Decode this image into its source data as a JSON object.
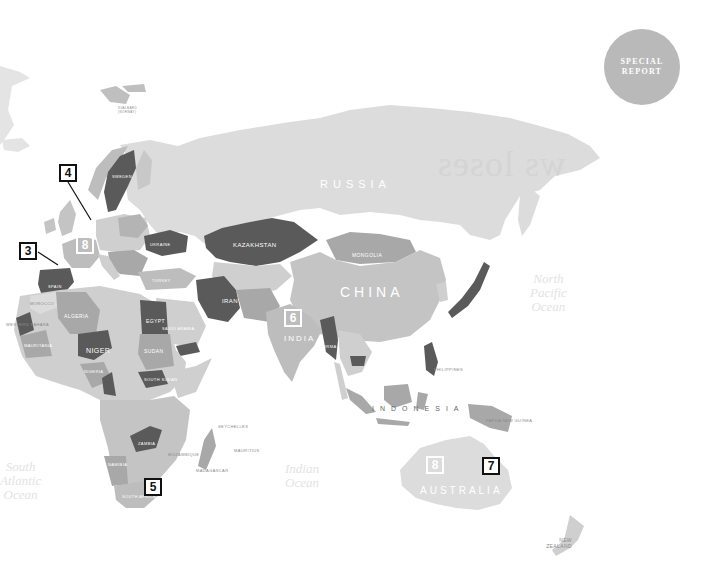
{
  "badge": {
    "line1": "SPECIAL",
    "line2": "REPORT"
  },
  "bleed_text": "ws loses",
  "markers": [
    {
      "id": "3",
      "label": "3",
      "style": "boxed"
    },
    {
      "id": "4",
      "label": "4",
      "style": "boxed"
    },
    {
      "id": "5",
      "label": "5",
      "style": "boxed"
    },
    {
      "id": "6",
      "label": "6",
      "style": "outline-white"
    },
    {
      "id": "7",
      "label": "7",
      "style": "boxed"
    },
    {
      "id": "8a",
      "label": "8",
      "style": "outline-white"
    },
    {
      "id": "8b",
      "label": "8",
      "style": "outline-white"
    }
  ],
  "countries": {
    "russia": "RUSSIA",
    "china": "CHINA",
    "india": "INDIA",
    "australia": "AUSTRALIA",
    "indonesia": "INDONESIA",
    "kazakhstan": "KAZAKHSTAN",
    "mongolia": "MONGOLIA",
    "iran": "IRAN",
    "niger": "NIGER",
    "egypt": "EGYPT",
    "sudan": "SUDAN",
    "algeria": "ALGERIA",
    "mauritania": "MAURITANIA",
    "morocco": "MOROCCO",
    "western_sahara": "WESTERN SAHARA",
    "nigeria": "NIGERIA",
    "south_sudan": "SOUTH SUDAN",
    "zambia": "ZAMBIA",
    "namibia": "NAMIBIA",
    "south_africa": "SOUTH AFRICA",
    "madagascar": "MADAGASCAR",
    "mozambique": "MOZAMBIQUE",
    "burma": "BURMA",
    "philippines": "PHILIPPINES",
    "papua_new_guinea": "PAPUA NEW GUINEA",
    "new_zealand": "NEW ZEALAND",
    "ukraine": "UKRAINE",
    "sweden": "SWEDEN",
    "spain": "SPAIN",
    "turkey": "TURKEY",
    "saudi_arabia": "SAUDI ARABIA",
    "seychelles": "SEYCHELLES",
    "mauritius": "MAURITIUS",
    "svalbard": "SVALBARD (NORWAY)"
  },
  "oceans": {
    "south_atlantic": [
      "South",
      "Atlantic",
      "Ocean"
    ],
    "indian": [
      "Indian",
      "Ocean"
    ],
    "north_pacific": [
      "North",
      "Pacific",
      "Ocean"
    ]
  },
  "colors": {
    "ocean": "#ffffff",
    "land_light": "#dcdcdc",
    "land_mid": "#bdbdbd",
    "land_medium_dark": "#a8a8a8",
    "land_dark": "#5a5a5a",
    "badge_circle": "#b9b9b9",
    "marker_border": "#111111"
  }
}
